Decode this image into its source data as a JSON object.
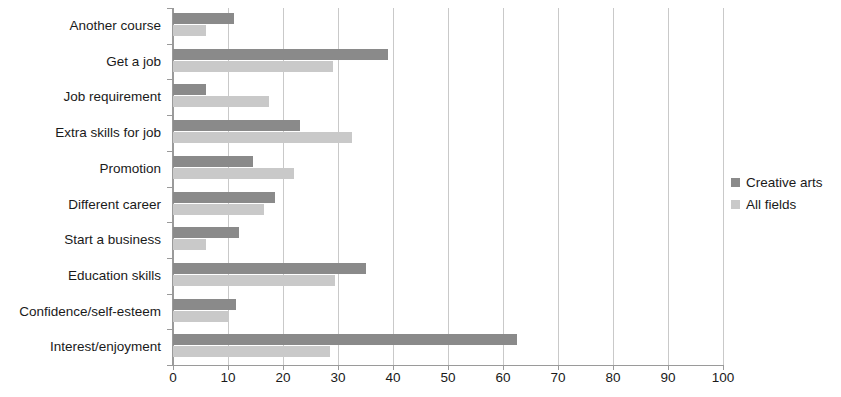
{
  "chart_data": {
    "type": "bar",
    "orientation": "horizontal",
    "title": "",
    "subtitle": "",
    "xlabel": "",
    "ylabel": "",
    "xlim": [
      0,
      100
    ],
    "xticks": [
      0,
      10,
      20,
      30,
      40,
      50,
      60,
      70,
      80,
      90,
      100
    ],
    "xtick_labels": [
      "0",
      "10",
      "20",
      "30",
      "40",
      "50",
      "60",
      "70",
      "80",
      "90",
      "100"
    ],
    "grid": "vertical",
    "legend_position": "right",
    "categories": [
      "Another course",
      "Get a job",
      "Job requirement",
      "Extra skills for job",
      "Promotion",
      "Different career",
      "Start a business",
      "Education skills",
      "Confidence/self-esteem",
      "Interest/enjoyment"
    ],
    "series": [
      {
        "name": "Creative arts",
        "color": "#8a8a8a",
        "values": [
          11,
          39,
          6,
          23,
          14.5,
          18.5,
          12,
          35,
          11.5,
          62.5
        ]
      },
      {
        "name": "All fields",
        "color": "#c9c9c9",
        "values": [
          6,
          29,
          17.5,
          32.5,
          22,
          16.5,
          6,
          29.5,
          10,
          28.5
        ]
      }
    ]
  },
  "legend": {
    "entries": [
      {
        "label": "Creative arts",
        "color": "#8a8a8a"
      },
      {
        "label": "All fields",
        "color": "#c9c9c9"
      }
    ]
  },
  "style": {
    "background": "#ffffff",
    "axis_color": "#9a9a9a",
    "grid_color": "#c9c9c9",
    "text_color": "#1a1a1a"
  }
}
